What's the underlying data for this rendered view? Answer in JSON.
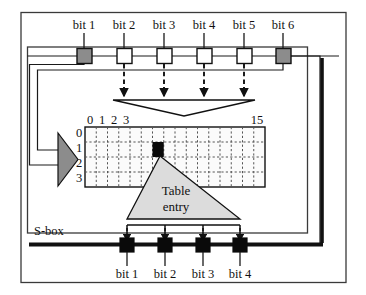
{
  "diagram": {
    "title": "S-box",
    "sbox_label": "S-box",
    "table_entry_label_line1": "Table",
    "table_entry_label_line2": "entry",
    "input_bits": [
      {
        "label": "bit 1",
        "fill": "gray",
        "role": "row-select"
      },
      {
        "label": "bit 2",
        "fill": "white",
        "role": "column-select"
      },
      {
        "label": "bit 3",
        "fill": "white",
        "role": "column-select"
      },
      {
        "label": "bit 4",
        "fill": "white",
        "role": "column-select"
      },
      {
        "label": "bit 5",
        "fill": "white",
        "role": "column-select"
      },
      {
        "label": "bit 6",
        "fill": "gray",
        "role": "row-select"
      }
    ],
    "output_bits": [
      {
        "label": "bit 1",
        "fill": "black"
      },
      {
        "label": "bit 2",
        "fill": "black"
      },
      {
        "label": "bit 3",
        "fill": "black"
      },
      {
        "label": "bit 4",
        "fill": "black"
      }
    ],
    "table": {
      "column_headers_shown": [
        "0",
        "1",
        "2",
        "3",
        "15"
      ],
      "row_headers": [
        "0",
        "1",
        "2",
        "3"
      ],
      "columns": 16,
      "rows": 4,
      "selected_cell": {
        "row": 1,
        "column": 6
      }
    },
    "colors": {
      "gray_fill": "#8c8c8c",
      "light_gray_fill": "#d0d0d0",
      "white_fill": "#ffffff",
      "black_fill": "#000000",
      "line": "#1a1a1a",
      "grid_dotted": "#555555",
      "frame": "#333333"
    }
  }
}
